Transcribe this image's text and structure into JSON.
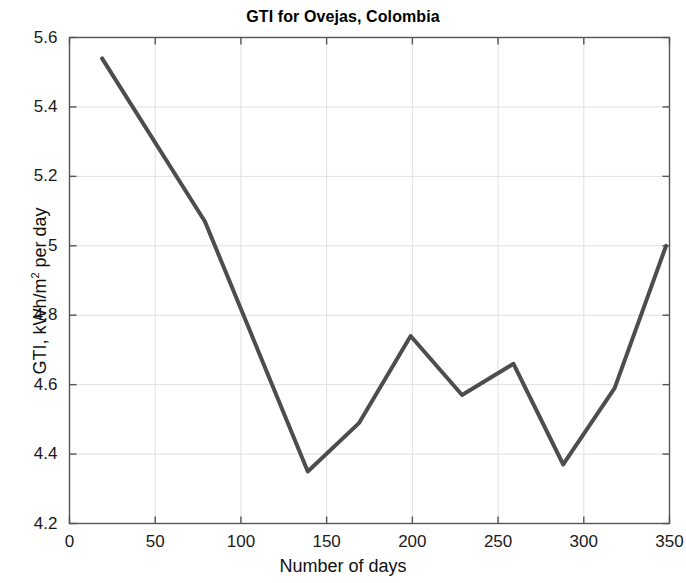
{
  "chart_data": {
    "type": "line",
    "title": "GTI for Ovejas, Colombia",
    "xlabel": "Number of days",
    "ylabel": "GTI, kWh/m2 per day",
    "ylabel_prefix": "GTI, kWh/m",
    "ylabel_sup": "2",
    "ylabel_suffix": " per day",
    "xlim": [
      0,
      350
    ],
    "ylim": [
      4.2,
      5.6
    ],
    "xticks": [
      0,
      50,
      100,
      150,
      200,
      250,
      300,
      350
    ],
    "xtick_labels": [
      "0",
      "50",
      "100",
      "150",
      "200",
      "250",
      "300",
      "350"
    ],
    "yticks": [
      4.2,
      4.4,
      4.6,
      4.8,
      5.0,
      5.2,
      5.4,
      5.6
    ],
    "ytick_labels": [
      "4.2",
      "4.4",
      "4.6",
      "4.8",
      "5",
      "5.2",
      "5.4",
      "5.6"
    ],
    "grid": true,
    "legend": null,
    "series": [
      {
        "name": "GTI",
        "color": "#4d4d4d",
        "line_width": 4,
        "x": [
          19,
          79,
          139,
          169,
          199,
          229,
          259,
          288,
          318,
          348
        ],
        "y": [
          5.54,
          5.07,
          4.35,
          4.49,
          4.74,
          4.57,
          4.66,
          4.37,
          4.59,
          5.0
        ]
      }
    ]
  },
  "axes": {
    "frame_color": "#555555",
    "grid_color": "#e0e0e0",
    "background": "#ffffff"
  }
}
